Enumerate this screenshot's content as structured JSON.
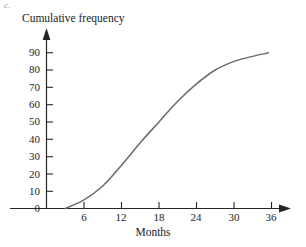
{
  "figure": {
    "part_label": "c.",
    "y_axis_title": "Cumulative frequency",
    "x_axis_title": "Months"
  },
  "chart_data": {
    "type": "line",
    "title": "",
    "subtitle": "",
    "xlabel": "Months",
    "ylabel": "Cumulative frequency",
    "xlim": [
      0,
      38
    ],
    "ylim": [
      0,
      95
    ],
    "xticks": [
      6,
      12,
      18,
      24,
      30,
      36
    ],
    "xtick_labels": [
      "6",
      "12",
      "18",
      "24",
      "30",
      "36"
    ],
    "yticks": [
      0,
      10,
      20,
      30,
      40,
      50,
      60,
      70,
      80,
      90
    ],
    "ytick_labels": [
      "0",
      "10",
      "20",
      "30",
      "40",
      "50",
      "60",
      "70",
      "80",
      "90"
    ],
    "grid": false,
    "legend": null,
    "axis_style": "arrow-ended",
    "series": [
      {
        "name": "Cumulative frequency",
        "x": [
          3,
          6,
          9,
          12,
          15,
          18,
          21,
          24,
          27,
          30,
          32,
          35.5
        ],
        "y": [
          0,
          5,
          13,
          25,
          38,
          50,
          62,
          72,
          80,
          85,
          87,
          90
        ]
      }
    ]
  },
  "colors": {
    "background": "#ffffff",
    "axis": "#262626",
    "curve": "#6b6b6b",
    "text": "#1d1d1d",
    "part_label": "#9a9a9a"
  }
}
